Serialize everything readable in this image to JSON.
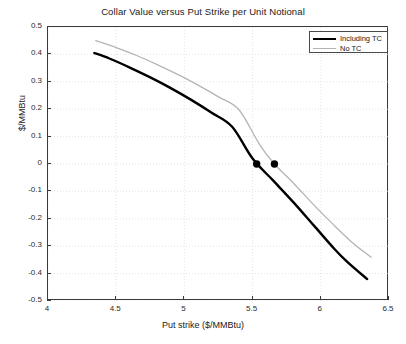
{
  "chart_data": {
    "type": "line",
    "title": "Collar Value versus Put Strike per Unit Notional",
    "xlabel": "Put strike ($/MMBtu)",
    "ylabel": "$/MMBtu",
    "xlim": [
      4,
      6.5
    ],
    "ylim": [
      -0.5,
      0.5
    ],
    "xticks": [
      "4",
      "4.5",
      "5",
      "5.5",
      "6",
      "6.5"
    ],
    "xtick_values": [
      4,
      4.5,
      5,
      5.5,
      6,
      6.5
    ],
    "yticks": [
      "0.5",
      "0.4",
      "0.3",
      "0.2",
      "0.1",
      "0",
      "-0.1",
      "-0.2",
      "-0.3",
      "-0.4",
      "-0.5"
    ],
    "ytick_values": [
      0.5,
      0.4,
      0.3,
      0.2,
      0.1,
      0,
      -0.1,
      -0.2,
      -0.3,
      -0.4,
      -0.5
    ],
    "grid": true,
    "grid_style": "dotted",
    "legend_position": "top-right",
    "series": [
      {
        "name": "Including TC",
        "color": "#000000",
        "width": 2.4,
        "x": [
          4.34,
          4.45,
          4.6,
          4.75,
          4.9,
          5.05,
          5.2,
          5.35,
          5.5,
          5.65,
          5.8,
          5.95,
          6.1,
          6.2,
          6.34
        ],
        "values": [
          0.405,
          0.385,
          0.352,
          0.316,
          0.277,
          0.234,
          0.187,
          0.136,
          0.02,
          -0.06,
          -0.14,
          -0.225,
          -0.31,
          -0.36,
          -0.42
        ]
      },
      {
        "name": "No TC",
        "color": "#b4b4b4",
        "width": 1.3,
        "x": [
          4.35,
          4.5,
          4.65,
          4.8,
          4.95,
          5.1,
          5.25,
          5.4,
          5.55,
          5.66,
          5.8,
          5.95,
          6.1,
          6.25,
          6.37
        ],
        "values": [
          0.45,
          0.425,
          0.396,
          0.363,
          0.327,
          0.288,
          0.245,
          0.198,
          0.072,
          0.0,
          -0.07,
          -0.15,
          -0.225,
          -0.295,
          -0.34
        ]
      }
    ],
    "markers": [
      {
        "label": "zero-crossing-including-tc",
        "x": 5.53,
        "y": 0.0,
        "color": "#000000",
        "size": 5
      },
      {
        "label": "zero-crossing-no-tc",
        "x": 5.66,
        "y": 0.0,
        "color": "#000000",
        "size": 5
      }
    ]
  },
  "legend": {
    "items": [
      {
        "label": "Including TC"
      },
      {
        "label": "No TC"
      }
    ]
  }
}
